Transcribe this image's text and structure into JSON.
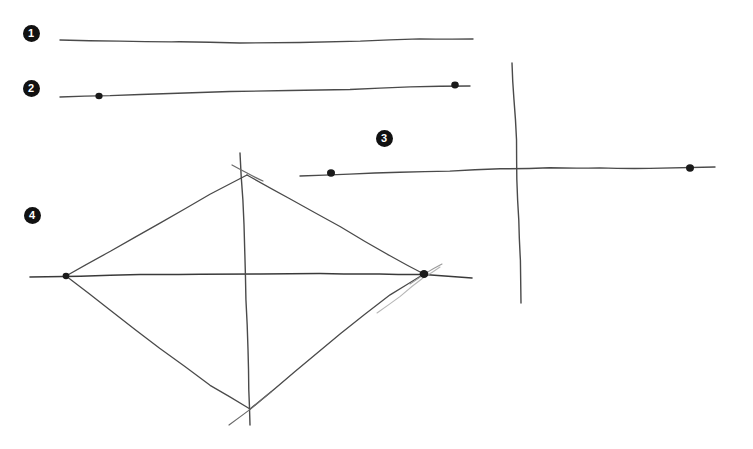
{
  "canvas": {
    "width": 753,
    "height": 449,
    "background_color": "#ffffff",
    "ink_color": "#4a4a4a",
    "ink_color_dark": "#3a3a3a",
    "faint_ink_color": "#b0b0b0",
    "dot_color": "#1a1a1a",
    "marker_fill": "#111111",
    "marker_text_color": "#ffffff",
    "description": "Hand-drawn pencil sketch of line segments and a diamond/kite figure with four numbered step markers"
  },
  "markers": [
    {
      "id": "marker-1",
      "label": "1",
      "x": 31,
      "y": 33
    },
    {
      "id": "marker-2",
      "label": "2",
      "x": 31,
      "y": 88
    },
    {
      "id": "marker-3",
      "label": "3",
      "x": 384,
      "y": 138
    },
    {
      "id": "marker-4",
      "label": "4",
      "x": 32,
      "y": 215
    }
  ],
  "strokes": [
    {
      "name": "line-1-horizontal",
      "step": "1",
      "kind": "freehand-line",
      "width": 1.4,
      "color": "#4a4a4a",
      "points": "60,40 120,41 180,42 240,43 300,42 360,41 420,39 473,39"
    },
    {
      "name": "line-2-horizontal",
      "step": "2",
      "kind": "freehand-line",
      "width": 1.4,
      "color": "#4a4a4a",
      "points": "60,97 110,96 170,94 230,92 290,91 350,89 410,87 470,86"
    },
    {
      "name": "line-3-horizontal",
      "step": "3",
      "kind": "freehand-line",
      "width": 1.4,
      "color": "#4a4a4a",
      "points": "300,176 350,174 400,172 450,171 500,169 550,168 600,168 650,168 715,167"
    },
    {
      "name": "line-3-vertical",
      "step": "3",
      "kind": "freehand-line",
      "width": 1.4,
      "color": "#4a4a4a",
      "points": "512,63 514,100 516,140 517,180 519,220 520,260 521,303"
    },
    {
      "name": "diamond-horizontal-axis",
      "step": "4",
      "kind": "freehand-line",
      "width": 1.6,
      "color": "#3a3a3a",
      "points": "30,277 80,276 140,275 200,274 260,274 320,274 380,274 424,274 472,278"
    },
    {
      "name": "diamond-vertical-axis",
      "step": "4",
      "kind": "freehand-line",
      "width": 1.4,
      "color": "#4a4a4a",
      "points": "240,153 243,200 245,250 246,300 248,350 249,390 250,425"
    },
    {
      "name": "diamond-edge-top-left",
      "step": "4",
      "kind": "freehand-line",
      "width": 1.3,
      "color": "#4a4a4a",
      "points": "66,276 110,251 160,223 210,194 247,175"
    },
    {
      "name": "diamond-edge-top-right",
      "step": "4",
      "kind": "freehand-line",
      "width": 1.3,
      "color": "#4a4a4a",
      "points": "247,175 290,199 340,227 390,256 424,274"
    },
    {
      "name": "diamond-edge-bottom-left",
      "step": "4",
      "kind": "freehand-line",
      "width": 1.3,
      "color": "#4a4a4a",
      "points": "66,276 110,310 160,348 210,385 250,409"
    },
    {
      "name": "diamond-edge-bottom-right",
      "step": "4",
      "kind": "freehand-line",
      "width": 1.3,
      "color": "#4a4a4a",
      "points": "250,409 295,372 340,334 390,295 424,274"
    },
    {
      "name": "diamond-edge-bottom-right-faint-duplicate",
      "step": "4",
      "kind": "freehand-line",
      "width": 1.1,
      "color": "#b6b6b6",
      "points": "377,313 400,296 425,277 440,267"
    },
    {
      "name": "tick-cross-top-vertex",
      "step": "4",
      "kind": "freehand-line",
      "width": 1.2,
      "color": "#6a6a6a",
      "points": "232,165 247,173 263,181"
    },
    {
      "name": "tick-cross-bottom-vertex",
      "step": "4",
      "kind": "freehand-line",
      "width": 1.2,
      "color": "#6a6a6a",
      "points": "229,425 250,409 271,392"
    },
    {
      "name": "tick-cross-right-vertex",
      "step": "4",
      "kind": "freehand-line",
      "width": 1.1,
      "color": "#9a9a9a",
      "points": "410,284 425,274 442,264"
    }
  ],
  "dots": [
    {
      "name": "dot-line-2-interior",
      "step": "2",
      "x": 99,
      "y": 96,
      "r": 3.6
    },
    {
      "name": "dot-line-2-endpoint",
      "step": "2",
      "x": 455,
      "y": 85,
      "r": 3.8
    },
    {
      "name": "dot-line-3-interior",
      "step": "3",
      "x": 331,
      "y": 173,
      "r": 4.0
    },
    {
      "name": "dot-line-3-endpoint",
      "step": "3",
      "x": 690,
      "y": 168,
      "r": 4.0
    },
    {
      "name": "dot-diamond-left-vertex",
      "step": "4",
      "x": 66,
      "y": 276,
      "r": 3.4
    },
    {
      "name": "dot-diamond-right-vertex",
      "step": "4",
      "x": 424,
      "y": 274,
      "r": 4.4
    }
  ]
}
